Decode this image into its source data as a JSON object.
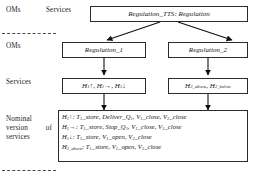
{
  "diagram": {
    "row_labels": [
      {
        "id": "oms-top",
        "text": "OMs"
      },
      {
        "id": "services-top",
        "text": "Services"
      },
      {
        "id": "oms-mid",
        "text": "OMs"
      },
      {
        "id": "services-mid",
        "text": "Services"
      },
      {
        "id": "nominal",
        "text": "Nominal version of services"
      }
    ],
    "nodes": {
      "root": {
        "label": "Regulation_TTS: Regulation"
      },
      "regulation_1": {
        "label": "Regulation_1"
      },
      "regulation_2": {
        "label": "Regulation_2"
      },
      "services_1": {
        "label": "H1↑, H1→, H1↓"
      },
      "services_2": {
        "label": "H2_above, H2_below"
      }
    },
    "nominal_box": {
      "lines": [
        "H1↑: T1_store, Deliver_Q1, V1_close, V2_close",
        "H1→: T1_store, Stop_Q1, V1_close, V2_close",
        "H1↓: T1_store, V1_open, V2_close",
        "H2_above: T1_store, V1_open, V2_close"
      ]
    },
    "colors": {
      "border": "#2b2b2b",
      "text": "#161616",
      "dash": "#4a4a4a",
      "background": "#ffffff"
    }
  }
}
